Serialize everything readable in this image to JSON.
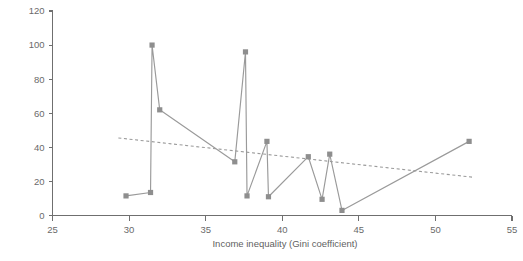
{
  "chart_data": {
    "type": "scatter",
    "title": "",
    "subtitle": "",
    "xlabel": "Income inequality (Gini coefficient)",
    "ylabel": "",
    "xlim": [
      25,
      55
    ],
    "ylim": [
      0,
      120
    ],
    "xticks": [
      25,
      30,
      35,
      40,
      45,
      50,
      55
    ],
    "xticklabels": [
      "25",
      "30",
      "35",
      "40",
      "45",
      "50",
      "55"
    ],
    "yticks": [
      0,
      20,
      40,
      60,
      80,
      100,
      120
    ],
    "yticklabels": [
      "0",
      "20",
      "40",
      "60",
      "80",
      "100",
      "120"
    ],
    "grid": false,
    "legend": null,
    "marker_style": "square",
    "connected": true,
    "x": [
      29.8,
      31.4,
      31.5,
      32.0,
      36.9,
      37.6,
      37.7,
      39.0,
      39.1,
      41.7,
      42.6,
      43.1,
      43.9,
      52.2
    ],
    "y": [
      11.5,
      13.5,
      100.0,
      62.0,
      31.5,
      96.0,
      11.5,
      43.5,
      11.0,
      34.5,
      9.5,
      36.0,
      3.0,
      43.5
    ],
    "series": [
      {
        "name": "data",
        "points": [
          {
            "x": 29.8,
            "y": 11.5
          },
          {
            "x": 31.4,
            "y": 13.5
          },
          {
            "x": 31.5,
            "y": 100.0
          },
          {
            "x": 32.0,
            "y": 62.0
          },
          {
            "x": 36.9,
            "y": 31.5
          },
          {
            "x": 37.6,
            "y": 96.0
          },
          {
            "x": 37.7,
            "y": 11.5
          },
          {
            "x": 39.0,
            "y": 43.5
          },
          {
            "x": 39.1,
            "y": 11.0
          },
          {
            "x": 41.7,
            "y": 34.5
          },
          {
            "x": 42.6,
            "y": 9.5
          },
          {
            "x": 43.1,
            "y": 36.0
          },
          {
            "x": 43.9,
            "y": 3.0
          },
          {
            "x": 52.2,
            "y": 43.5
          }
        ]
      }
    ],
    "trendline": {
      "style": "dashed",
      "x0": 29.3,
      "y0": 45.5,
      "x1": 52.4,
      "y1": 22.5
    },
    "colors": {
      "marker": "#8e8e8e",
      "line": "#9a9a9a",
      "trend": "#9a9a9a",
      "axis": "#6f6f6f",
      "text": "#6a6a6a",
      "background": "#ffffff"
    }
  }
}
